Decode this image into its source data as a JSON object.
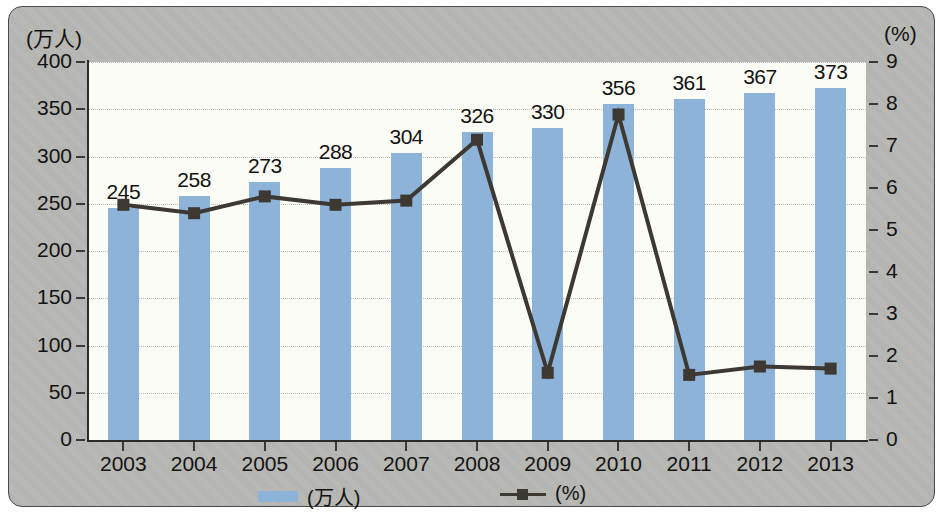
{
  "chart_data": {
    "type": "bar",
    "title": "",
    "categories": [
      "2003",
      "2004",
      "2005",
      "2006",
      "2007",
      "2008",
      "2009",
      "2010",
      "2011",
      "2012",
      "2013"
    ],
    "xlabel": "",
    "ylabel": "(万人)",
    "y2label": "(%)",
    "ylim": [
      0,
      400
    ],
    "y2lim": [
      0,
      9
    ],
    "yticks": [
      "0",
      "50",
      "100",
      "150",
      "200",
      "250",
      "300",
      "350",
      "400"
    ],
    "ytick_values": [
      0,
      50,
      100,
      150,
      200,
      250,
      300,
      350,
      400
    ],
    "y2ticks": [
      "0",
      "1",
      "2",
      "3",
      "4",
      "5",
      "6",
      "7",
      "8",
      "9"
    ],
    "y2tick_values": [
      0,
      1,
      2,
      3,
      4,
      5,
      6,
      7,
      8,
      9
    ],
    "grid": true,
    "legend_position": "bottom",
    "series": [
      {
        "name": "(万人)",
        "type": "bar",
        "axis": "left",
        "color": "#8db3d8",
        "values": [
          245,
          258,
          273,
          288,
          304,
          326,
          330,
          356,
          361,
          367,
          373
        ],
        "labels": [
          "245",
          "258",
          "273",
          "288",
          "304",
          "326",
          "330",
          "356",
          "361",
          "367",
          "373"
        ]
      },
      {
        "name": "(%)",
        "type": "line",
        "axis": "right",
        "color": "#3d3832",
        "marker": "square",
        "values": [
          5.6,
          5.4,
          5.8,
          5.6,
          5.7,
          7.15,
          1.6,
          7.75,
          1.55,
          1.75,
          1.7
        ]
      }
    ]
  },
  "legend": {
    "items": [
      {
        "label": "(万人)",
        "marker": "bar-swatch"
      },
      {
        "label": "(%)",
        "marker": "line-square-marker"
      }
    ]
  }
}
